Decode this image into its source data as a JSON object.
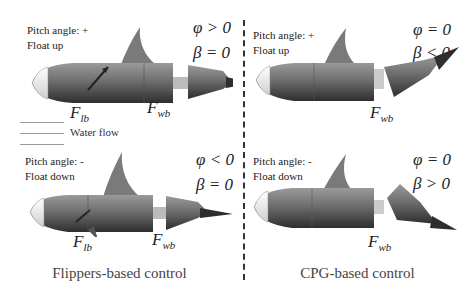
{
  "panels": [
    {
      "id": "flippers-up",
      "pitch_label": "Pitch angle: +",
      "float_label": "Float up",
      "phi_eq": "φ > 0",
      "beta_eq": "β = 0",
      "forces": [
        "F",
        "F"
      ],
      "force_subs": [
        "lb",
        "wb"
      ]
    },
    {
      "id": "cpg-up",
      "pitch_label": "Pitch angle: +",
      "float_label": "Float up",
      "phi_eq": "φ = 0",
      "beta_eq": "β < 0",
      "forces": [
        "F"
      ],
      "force_subs": [
        "wb"
      ]
    },
    {
      "id": "flippers-down",
      "pitch_label": "Pitch angle: -",
      "float_label": "Float down",
      "phi_eq": "φ < 0",
      "beta_eq": "β = 0",
      "forces": [
        "F",
        "F"
      ],
      "force_subs": [
        "lb",
        "wb"
      ]
    },
    {
      "id": "cpg-down",
      "pitch_label": "Pitch angle: -",
      "float_label": "Float down",
      "phi_eq": "φ = 0",
      "beta_eq": "β > 0",
      "forces": [
        "F"
      ],
      "force_subs": [
        "wb"
      ]
    }
  ],
  "water_flow_label": "Water flow",
  "captions": {
    "left": "Flippers-based control",
    "right": "CPG-based control"
  },
  "colors": {
    "body": "#6e6e6e",
    "body_dark": "#3c3c3c",
    "fin": "#7a7a7a",
    "nose": "#e8e8e8"
  }
}
